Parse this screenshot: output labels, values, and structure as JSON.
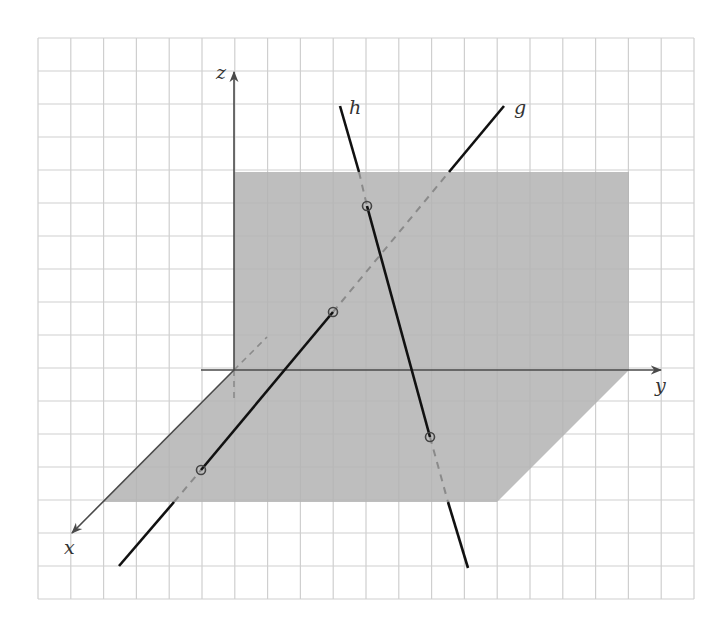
{
  "diagram": {
    "title": "",
    "grid": {
      "x0": 38,
      "y0": 38,
      "x1": 694,
      "y1": 599,
      "cols": 20,
      "rows": 17,
      "color": "#cfcfcf"
    },
    "colors": {
      "plane": "#b3b3b3",
      "axis": "#4a4a4a",
      "line": "#111111",
      "hidden": "#8a8a8a",
      "point_ring": "#444444"
    },
    "axes": {
      "x": {
        "label": "x",
        "from": [
          234,
          370
        ],
        "to": [
          72,
          533
        ],
        "label_pos": [
          64,
          554
        ]
      },
      "y": {
        "label": "y",
        "from": [
          201,
          370
        ],
        "to": [
          661,
          370
        ],
        "label_pos": [
          655,
          392
        ]
      },
      "z": {
        "label": "z",
        "from": [
          234,
          370
        ],
        "to": [
          234,
          72
        ],
        "label_pos": [
          216,
          79
        ]
      }
    },
    "planes": [
      {
        "name": "yz-plane",
        "points": [
          [
            234,
            172
          ],
          [
            629,
            172
          ],
          [
            629,
            370
          ],
          [
            234,
            370
          ]
        ]
      },
      {
        "name": "xy-plane",
        "points": [
          [
            234,
            370
          ],
          [
            629,
            370
          ],
          [
            497,
            502
          ],
          [
            103,
            502
          ]
        ]
      }
    ],
    "lines": [
      {
        "label": "g",
        "label_pos": [
          514,
          114
        ],
        "solid": [
          [
            [
              119,
              566
            ],
            [
              174,
              502
            ]
          ],
          [
            [
              201,
              470
            ],
            [
              333,
              312
            ]
          ],
          [
            [
              449,
              172
            ],
            [
              504,
              106
            ]
          ]
        ],
        "dashed": [
          [
            [
              174,
              502
            ],
            [
              201,
              470
            ]
          ],
          [
            [
              333,
              312
            ],
            [
              449,
              172
            ]
          ]
        ]
      },
      {
        "label": "h",
        "label_pos": [
          349,
          114
        ],
        "solid": [
          [
            [
              340,
              106
            ],
            [
              359,
              172
            ]
          ],
          [
            [
              367,
              206
            ],
            [
              430,
              437
            ]
          ],
          [
            [
              448,
              502
            ],
            [
              468,
              568
            ]
          ]
        ],
        "dashed": [
          [
            [
              359,
              172
            ],
            [
              367,
              206
            ]
          ],
          [
            [
              430,
              437
            ],
            [
              448,
              502
            ]
          ]
        ]
      }
    ],
    "hidden_axis_segments": [
      [
        [
          234,
          370
        ],
        [
          234,
          403
        ]
      ],
      [
        [
          234,
          370
        ],
        [
          267,
          337
        ]
      ]
    ],
    "points": [
      {
        "name": "h-yz-intersection",
        "pos": [
          367,
          206
        ]
      },
      {
        "name": "g-yz-intersection",
        "pos": [
          333,
          312
        ]
      },
      {
        "name": "g-xy-intersection",
        "pos": [
          201,
          470
        ]
      },
      {
        "name": "h-xy-intersection",
        "pos": [
          430,
          437
        ]
      }
    ]
  }
}
